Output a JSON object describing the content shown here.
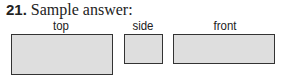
{
  "problem": {
    "number": "21.",
    "title": "Sample answer:"
  },
  "views": [
    {
      "label": "top",
      "shape": "rectangle"
    },
    {
      "label": "side",
      "shape": "rectangle"
    },
    {
      "label": "front",
      "shape": "rectangle"
    }
  ],
  "colors": {
    "fill": "#dedede",
    "border": "#333333"
  }
}
